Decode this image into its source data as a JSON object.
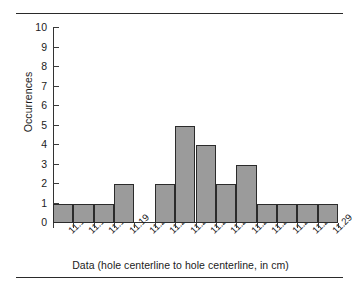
{
  "chart_data": {
    "type": "bar",
    "title": "",
    "subtitle": "",
    "xlabel": "Data (hole centerline to hole centerline, in cm)",
    "ylabel": "Occurrences",
    "categories": [
      "11.16",
      "11.17",
      "11.18",
      "11.19",
      "11.20",
      "11.21",
      "11.22",
      "11.23",
      "11.24",
      "11.25",
      "11.26",
      "11.27",
      "11.28",
      "11.29"
    ],
    "values": [
      1,
      1,
      1,
      2,
      0,
      2,
      5,
      4,
      2,
      3,
      1,
      1,
      1,
      1
    ],
    "ylim": [
      0,
      10
    ],
    "ytick_labels": [
      "0",
      "1",
      "2",
      "3",
      "4",
      "5",
      "6",
      "7",
      "8",
      "9",
      "10"
    ],
    "ytick_values": [
      0,
      1,
      2,
      3,
      4,
      5,
      6,
      7,
      8,
      9,
      10
    ],
    "grid": false,
    "legend": null,
    "bar_color": "#9b9b9b",
    "bar_edge_color": "#2b2b2b",
    "axis_color": "#333333",
    "text_color": "#1b1b1b",
    "annotations": []
  },
  "decorations": {
    "rule_top": "horizontal-rule",
    "rule_bottom": "horizontal-rule"
  }
}
